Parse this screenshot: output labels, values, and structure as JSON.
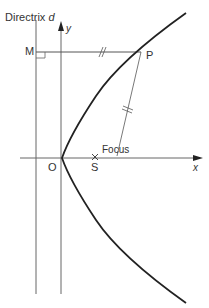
{
  "diagram": {
    "labels": {
      "directrix": "Directrix",
      "directrix_symbol": "d",
      "y_axis": "y",
      "x_axis": "x",
      "point_m": "M",
      "point_p": "P",
      "origin": "O",
      "focus_point": "S",
      "focus_label": "Focus"
    },
    "colors": {
      "curve": "#222222",
      "lines": "#555555",
      "text": "#333333"
    }
  }
}
